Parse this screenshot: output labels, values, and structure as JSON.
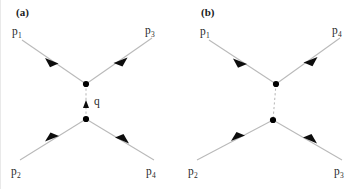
{
  "figure": {
    "background_color": "#ffffff",
    "line_color": "#b9b9b9",
    "vertex_color": "#000000",
    "text_color": "#2a2a2a",
    "width": 354,
    "height": 189
  },
  "panels": [
    {
      "id": "a",
      "label": "(a)",
      "propagator": {
        "style": "dashed",
        "label": "q",
        "has_arrow": true,
        "arrow_direction": "up"
      },
      "legs": [
        {
          "name": "p1-leg",
          "label": "p",
          "subscript": "1",
          "position": "top-left",
          "arrow_direction": "inward"
        },
        {
          "name": "p3-leg",
          "label": "p",
          "subscript": "3",
          "position": "top-right",
          "arrow_direction": "inward"
        },
        {
          "name": "p2-leg",
          "label": "p",
          "subscript": "2",
          "position": "bottom-left",
          "arrow_direction": "inward"
        },
        {
          "name": "p4-leg",
          "label": "p",
          "subscript": "4",
          "position": "bottom-right",
          "arrow_direction": "inward"
        }
      ]
    },
    {
      "id": "b",
      "label": "(b)",
      "propagator": {
        "style": "dashed",
        "label": "",
        "has_arrow": false,
        "arrow_direction": ""
      },
      "legs": [
        {
          "name": "p1-leg",
          "label": "p",
          "subscript": "1",
          "position": "top-left",
          "arrow_direction": "inward"
        },
        {
          "name": "p4-leg",
          "label": "p",
          "subscript": "4",
          "position": "top-right",
          "arrow_direction": "inward"
        },
        {
          "name": "p2-leg",
          "label": "p",
          "subscript": "2",
          "position": "bottom-left",
          "arrow_direction": "inward"
        },
        {
          "name": "p3-leg",
          "label": "p",
          "subscript": "3",
          "position": "bottom-right",
          "arrow_direction": "inward"
        }
      ]
    }
  ]
}
